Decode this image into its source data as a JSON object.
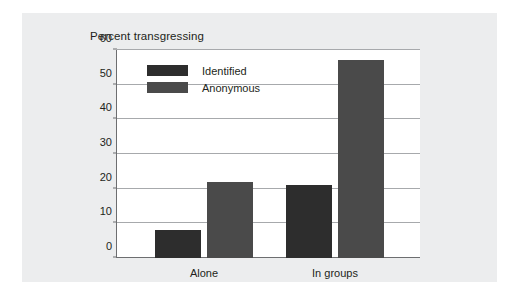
{
  "chart_data": {
    "type": "bar",
    "title": "Percent transgressing",
    "xlabel": "",
    "ylabel": "",
    "categories": [
      "Alone",
      "In groups"
    ],
    "series": [
      {
        "name": "Identified",
        "color": "#2d2d2d",
        "values": [
          8,
          21
        ]
      },
      {
        "name": "Anonymous",
        "color": "#4a4a4a",
        "values": [
          22,
          57
        ]
      }
    ],
    "ylim": [
      0,
      60
    ],
    "yticks": [
      0,
      10,
      20,
      30,
      40,
      50,
      60
    ],
    "ytick_labels": [
      "0",
      "10",
      "20",
      "30",
      "40",
      "50",
      "60"
    ],
    "grid": true,
    "legend_position": "top-left-inside"
  },
  "figure": {
    "background_color": "#ecedee",
    "plot_background_color": "#ffffff",
    "axis_color": "#6d6e70",
    "gridline_color": "#a7a9ac"
  }
}
